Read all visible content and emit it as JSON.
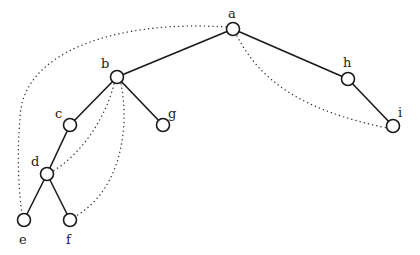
{
  "diagram": {
    "type": "binary-tree-with-threads",
    "nodes": [
      {
        "id": "a",
        "label": "a",
        "x": 233,
        "y": 29,
        "lx": 228,
        "ly": 18
      },
      {
        "id": "b",
        "label": "b",
        "x": 117,
        "y": 77,
        "lx": 101,
        "ly": 68
      },
      {
        "id": "h",
        "label": "h",
        "x": 348,
        "y": 79,
        "lx": 343,
        "ly": 67
      },
      {
        "id": "i",
        "label": "i",
        "x": 393,
        "y": 126,
        "lx": 398,
        "ly": 117
      },
      {
        "id": "c",
        "label": "c",
        "x": 70,
        "y": 125,
        "lx": 55,
        "ly": 118
      },
      {
        "id": "g",
        "label": "g",
        "x": 163,
        "y": 125,
        "lx": 168,
        "ly": 118
      },
      {
        "id": "d",
        "label": "d",
        "x": 47,
        "y": 174,
        "lx": 31,
        "ly": 166
      },
      {
        "id": "e",
        "label": "e",
        "x": 24,
        "y": 220,
        "lx": 19,
        "ly": 244
      },
      {
        "id": "f",
        "label": "f",
        "x": 70,
        "y": 220,
        "lx": 66,
        "ly": 244
      }
    ],
    "edges": [
      [
        "a",
        "b"
      ],
      [
        "a",
        "h"
      ],
      [
        "h",
        "i"
      ],
      [
        "b",
        "c"
      ],
      [
        "b",
        "g"
      ],
      [
        "c",
        "d"
      ],
      [
        "d",
        "e"
      ],
      [
        "d",
        "f"
      ]
    ],
    "threads": [
      {
        "from": "a",
        "to": "e",
        "path": "M226,27 C120,20 20,50 20,120 C16,160 20,200 22,214"
      },
      {
        "from": "a",
        "to": "i",
        "path": "M237,36 C260,80 300,110 387,128"
      },
      {
        "from": "b",
        "to": "d",
        "path": "M114,84 C105,120 80,155 53,171"
      },
      {
        "from": "b",
        "to": "f",
        "path": "M121,84 C130,130 120,190 76,216"
      }
    ]
  }
}
